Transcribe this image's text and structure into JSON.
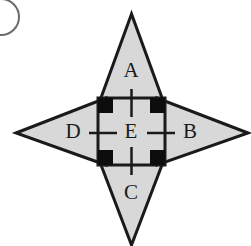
{
  "figure": {
    "width": 251,
    "height": 246,
    "background_color": "#ffffff"
  },
  "colors": {
    "fill_gray": "#d8d8d8",
    "stroke_black": "#1a1a1a",
    "corner_black": "#0d0d0d",
    "arc_gray": "#6b6b6b",
    "label_color": "#1a1a1a"
  },
  "corner_mark": {
    "name": "partial-circle-arc",
    "center_x": 1,
    "center_y": 17,
    "radius": 18
  },
  "star": {
    "name": "four-pointed-star",
    "center_x": 131.5,
    "center_y": 131.5,
    "tip_top": {
      "x": 131.5,
      "y": 14
    },
    "tip_right": {
      "x": 248,
      "y": 133
    },
    "tip_bottom": {
      "x": 131.5,
      "y": 245
    },
    "tip_left": {
      "x": 16,
      "y": 133
    }
  },
  "square": {
    "name": "center-square",
    "left": 98,
    "top": 98,
    "right": 165,
    "bottom": 165,
    "corner_block_size": 15
  },
  "labels": {
    "top": "A",
    "right": "B",
    "bottom": "C",
    "left": "D",
    "center": "E"
  },
  "label_positions": {
    "top": {
      "x": 131,
      "y": 72
    },
    "right": {
      "x": 190,
      "y": 133
    },
    "bottom": {
      "x": 131,
      "y": 194
    },
    "left": {
      "x": 73,
      "y": 133
    },
    "center": {
      "x": 131,
      "y": 133
    }
  },
  "tick_marks": [
    {
      "name": "tick-top",
      "x1": 131.5,
      "y1": 89,
      "x2": 131.5,
      "y2": 117
    },
    {
      "name": "tick-bottom",
      "x1": 131.5,
      "y1": 147,
      "x2": 131.5,
      "y2": 175
    },
    {
      "name": "tick-left",
      "x1": 89,
      "y1": 133,
      "x2": 117,
      "y2": 133
    },
    {
      "name": "tick-right",
      "x1": 147,
      "y1": 133,
      "x2": 175,
      "y2": 133
    }
  ]
}
